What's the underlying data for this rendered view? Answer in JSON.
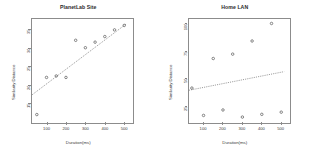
{
  "figure": {
    "kind": "two-panel-scatter-with-regression",
    "background": "#ffffff",
    "axis_color": "#8c8c8c",
    "point_color": "#4a4a4a",
    "line_color": "#555555"
  },
  "panels": [
    {
      "id": "planetlab",
      "title": "PlanetLab Site",
      "xlabel": "Duration(ms)",
      "ylabel": "Similarity Distance"
    },
    {
      "id": "homelan",
      "title": "Home LAN",
      "xlabel": "Duration(ms)",
      "ylabel": "Similarity Distance"
    }
  ],
  "chart_data": [
    {
      "type": "scatter",
      "title": "PlanetLab Site",
      "xlabel": "Duration(ms)",
      "ylabel": "Similarity Distance",
      "xlim": [
        20,
        540
      ],
      "ylim": [
        10,
        38
      ],
      "grid": false,
      "legend": null,
      "xticks": [
        100,
        200,
        300,
        400,
        500
      ],
      "yticks": [
        15,
        20,
        25,
        30,
        35
      ],
      "x": [
        50,
        100,
        150,
        200,
        250,
        300,
        350,
        400,
        450,
        500
      ],
      "y": [
        12.0,
        22.0,
        22.4,
        22.0,
        32.0,
        30.0,
        31.5,
        33.0,
        34.8,
        36.0
      ],
      "trendline": {
        "style": "dashed",
        "x": [
          25,
          510
        ],
        "y": [
          17.3,
          36.4
        ]
      }
    },
    {
      "type": "scatter",
      "title": "Home LAN",
      "xlabel": "Duration(ms)",
      "ylabel": "Similarity Distance",
      "xlim": [
        20,
        540
      ],
      "ylim": [
        10,
        105
      ],
      "grid": false,
      "legend": null,
      "xticks": [
        100,
        200,
        300,
        400,
        500
      ],
      "yticks": [
        25,
        50,
        75,
        100
      ],
      "x": [
        40,
        100,
        150,
        200,
        250,
        300,
        350,
        400,
        450,
        500
      ],
      "y": [
        41.0,
        16.0,
        68.0,
        21.0,
        72.0,
        14.5,
        84.0,
        17.0,
        100.0,
        19.0
      ],
      "trendline": {
        "style": "dashed",
        "x": [
          25,
          515
        ],
        "y": [
          39.0,
          56.0
        ]
      }
    }
  ]
}
